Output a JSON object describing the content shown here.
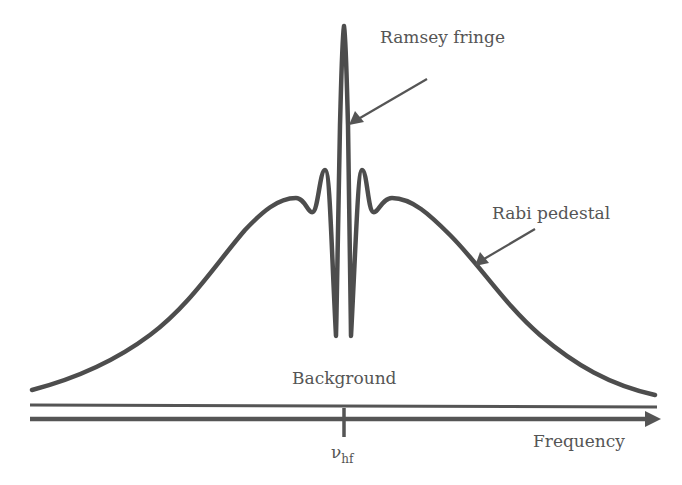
{
  "figure": {
    "labels": {
      "ramsey": "Ramsey fringe",
      "rabi": "Rabi pedestal",
      "background": "Background",
      "frequency": "Frequency",
      "center_symbol": "ν",
      "center_sub": "hf"
    },
    "colors": {
      "curve": "#4d4d4d",
      "axis": "#555555",
      "text": "#555555",
      "background": "#ffffff"
    }
  }
}
